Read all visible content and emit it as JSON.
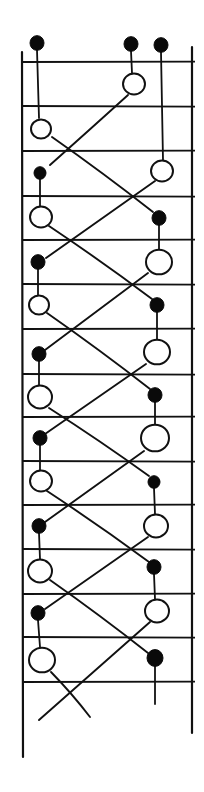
{
  "figure": {
    "colors": {
      "ink": "#111111",
      "background": "#ffffff",
      "filled_bead": "#0a0a0a",
      "open_bead_fill": "#ffffff"
    },
    "rails": [
      {
        "id": "left-rail",
        "x": 22,
        "y1": 52,
        "y2": 757
      },
      {
        "id": "right-rail",
        "x": 192,
        "y1": 47,
        "y2": 733
      }
    ],
    "rungs_y": [
      62,
      106,
      151,
      196,
      240,
      284,
      329,
      374,
      417,
      461,
      505,
      549,
      594,
      637,
      682
    ],
    "rung_x": [
      22,
      195
    ],
    "top_beads": [
      {
        "type": "filled",
        "x": 37,
        "y": 43,
        "r": 7
      },
      {
        "type": "filled",
        "x": 131,
        "y": 44,
        "r": 7
      },
      {
        "type": "filled",
        "x": 161,
        "y": 45,
        "r": 7
      }
    ],
    "left_column": [
      {
        "type": "open",
        "x": 41,
        "y": 129,
        "r": 10
      },
      {
        "type": "filled",
        "x": 40,
        "y": 173,
        "r": 6
      },
      {
        "type": "open",
        "x": 41,
        "y": 217,
        "r": 11
      },
      {
        "type": "filled",
        "x": 38,
        "y": 262,
        "r": 7
      },
      {
        "type": "open",
        "x": 39,
        "y": 305,
        "r": 10
      },
      {
        "type": "filled",
        "x": 39,
        "y": 354,
        "r": 7
      },
      {
        "type": "open",
        "x": 40,
        "y": 397,
        "r": 12
      },
      {
        "type": "filled",
        "x": 40,
        "y": 438,
        "r": 7
      },
      {
        "type": "open",
        "x": 41,
        "y": 481,
        "r": 11
      },
      {
        "type": "filled",
        "x": 39,
        "y": 526,
        "r": 7
      },
      {
        "type": "open",
        "x": 40,
        "y": 571,
        "r": 12
      },
      {
        "type": "filled",
        "x": 38,
        "y": 613,
        "r": 7
      },
      {
        "type": "open",
        "x": 42,
        "y": 660,
        "r": 13
      }
    ],
    "right_column": [
      {
        "type": "open",
        "x": 134,
        "y": 84,
        "r": 11
      },
      {
        "type": "open",
        "x": 162,
        "y": 171,
        "r": 11
      },
      {
        "type": "filled",
        "x": 159,
        "y": 218,
        "r": 7
      },
      {
        "type": "open",
        "x": 159,
        "y": 262,
        "r": 13
      },
      {
        "type": "filled",
        "x": 157,
        "y": 305,
        "r": 7
      },
      {
        "type": "open",
        "x": 157,
        "y": 352,
        "r": 13
      },
      {
        "type": "filled",
        "x": 155,
        "y": 395,
        "r": 7
      },
      {
        "type": "open",
        "x": 155,
        "y": 438,
        "r": 14
      },
      {
        "type": "filled",
        "x": 154,
        "y": 482,
        "r": 6
      },
      {
        "type": "open",
        "x": 156,
        "y": 526,
        "r": 12
      },
      {
        "type": "filled",
        "x": 154,
        "y": 567,
        "r": 7
      },
      {
        "type": "open",
        "x": 157,
        "y": 611,
        "r": 12
      },
      {
        "type": "filled",
        "x": 155,
        "y": 658,
        "r": 8
      }
    ],
    "stems": [
      [
        37,
        50,
        39,
        118
      ],
      [
        131,
        51,
        132,
        73
      ],
      [
        161,
        52,
        163,
        160
      ],
      [
        40,
        179,
        40,
        206
      ],
      [
        38,
        269,
        38,
        295
      ],
      [
        39,
        361,
        39,
        385
      ],
      [
        40,
        445,
        40,
        470
      ],
      [
        39,
        533,
        40,
        559
      ],
      [
        38,
        620,
        40,
        647
      ],
      [
        159,
        225,
        159,
        249
      ],
      [
        157,
        312,
        157,
        339
      ],
      [
        155,
        402,
        155,
        424
      ],
      [
        154,
        488,
        155,
        514
      ],
      [
        154,
        574,
        155,
        599
      ],
      [
        155,
        666,
        155,
        704
      ]
    ],
    "crossings": [
      [
        128,
        95,
        50,
        165
      ],
      [
        52,
        137,
        153,
        212
      ],
      [
        155,
        181,
        46,
        258
      ],
      [
        49,
        226,
        152,
        299
      ],
      [
        148,
        273,
        45,
        350
      ],
      [
        47,
        313,
        150,
        389
      ],
      [
        146,
        364,
        45,
        434
      ],
      [
        49,
        408,
        149,
        476
      ],
      [
        144,
        451,
        45,
        522
      ],
      [
        47,
        491,
        149,
        562
      ],
      [
        148,
        537,
        45,
        609
      ],
      [
        50,
        580,
        148,
        653
      ],
      [
        150,
        622,
        39,
        720
      ],
      [
        51,
        672,
        90,
        717
      ]
    ]
  }
}
